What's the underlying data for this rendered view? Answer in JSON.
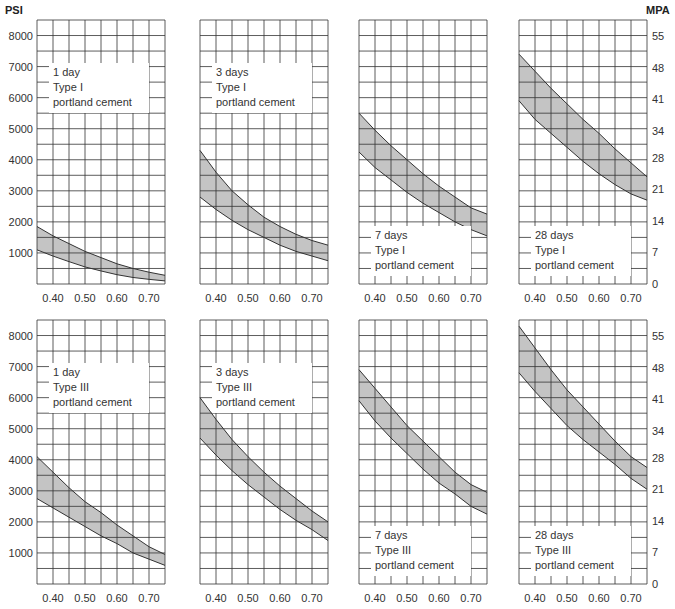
{
  "chart_data": {
    "type": "area",
    "title": "",
    "left_axis_unit": "PSI",
    "right_axis_unit": "MPA",
    "x_ticks": [
      "0.40",
      "0.50",
      "0.60",
      "0.70"
    ],
    "x_values": [
      0.35,
      0.4,
      0.45,
      0.5,
      0.55,
      0.6,
      0.65,
      0.7,
      0.75
    ],
    "xlim": [
      0.35,
      0.75
    ],
    "ylim_psi": [
      0,
      8500
    ],
    "ylim_mpa": [
      0,
      58.6
    ],
    "psi_ticks": [
      "1000",
      "2000",
      "3000",
      "4000",
      "5000",
      "6000",
      "7000",
      "8000"
    ],
    "mpa_ticks": [
      "0",
      "7",
      "14",
      "21",
      "28",
      "34",
      "41",
      "48",
      "55"
    ],
    "grid": true,
    "panels": [
      {
        "name": "1 day Type I",
        "label": [
          "1 day",
          "Type I",
          "portland cement"
        ],
        "label_pos": "top",
        "upper": [
          1850,
          1550,
          1300,
          1050,
          850,
          650,
          500,
          380,
          280
        ],
        "lower": [
          1100,
          900,
          720,
          550,
          420,
          300,
          210,
          150,
          100
        ]
      },
      {
        "name": "3 days Type I",
        "label": [
          "3 days",
          "Type I",
          "portland cement"
        ],
        "label_pos": "top",
        "upper": [
          4300,
          3600,
          3000,
          2550,
          2150,
          1850,
          1600,
          1400,
          1250
        ],
        "lower": [
          2800,
          2400,
          2050,
          1750,
          1500,
          1250,
          1050,
          900,
          750
        ]
      },
      {
        "name": "7 days Type I",
        "label": [
          "7 days",
          "Type I",
          "portland cement"
        ],
        "label_pos": "bottom",
        "upper": [
          5500,
          4950,
          4450,
          4000,
          3550,
          3150,
          2800,
          2450,
          2250
        ],
        "lower": [
          4250,
          3750,
          3350,
          2950,
          2600,
          2300,
          2000,
          1750,
          1550
        ]
      },
      {
        "name": "28 days Type I",
        "label": [
          "28 days",
          "Type I",
          "portland cement"
        ],
        "label_pos": "bottom",
        "upper": [
          7400,
          6850,
          6300,
          5800,
          5300,
          4850,
          4350,
          3900,
          3450
        ],
        "lower": [
          5900,
          5300,
          4850,
          4400,
          3950,
          3550,
          3200,
          2900,
          2700
        ]
      },
      {
        "name": "1 day Type III",
        "label": [
          "1 day",
          "Type III",
          "portland cement"
        ],
        "label_pos": "top",
        "upper": [
          4100,
          3600,
          3100,
          2650,
          2300,
          1900,
          1550,
          1200,
          950
        ],
        "lower": [
          2750,
          2450,
          2150,
          1850,
          1550,
          1300,
          1000,
          800,
          600
        ]
      },
      {
        "name": "3 days Type III",
        "label": [
          "3 days",
          "Type III",
          "portland cement"
        ],
        "label_pos": "top",
        "upper": [
          6000,
          5300,
          4650,
          4100,
          3600,
          3150,
          2750,
          2350,
          2000
        ],
        "lower": [
          4700,
          4150,
          3650,
          3200,
          2800,
          2400,
          2050,
          1750,
          1400
        ]
      },
      {
        "name": "7 days Type III",
        "label": [
          "7 days",
          "Type III",
          "portland cement"
        ],
        "label_pos": "bottom",
        "upper": [
          6900,
          6300,
          5700,
          5100,
          4600,
          4100,
          3600,
          3200,
          2950
        ],
        "lower": [
          5900,
          5250,
          4700,
          4200,
          3700,
          3250,
          2900,
          2500,
          2250
        ]
      },
      {
        "name": "28 days Type III",
        "label": [
          "28 days",
          "Type III",
          "portland cement"
        ],
        "label_pos": "bottom",
        "upper": [
          8300,
          7600,
          6900,
          6250,
          5700,
          5150,
          4600,
          4100,
          3750
        ],
        "lower": [
          6800,
          6200,
          5650,
          5100,
          4650,
          4250,
          3850,
          3400,
          3050
        ]
      }
    ]
  }
}
